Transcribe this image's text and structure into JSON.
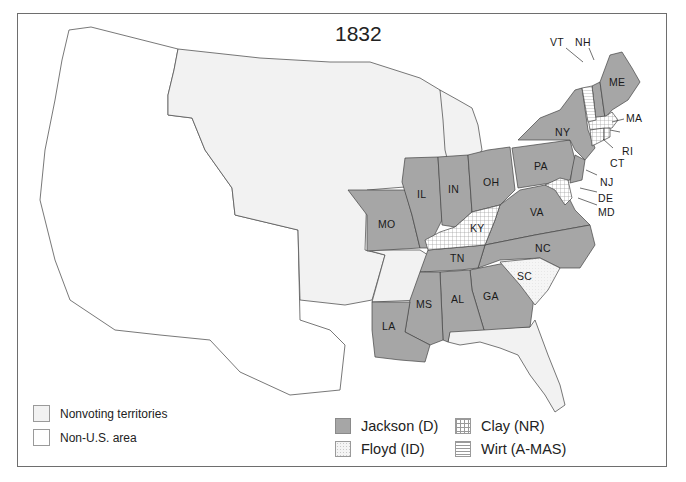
{
  "map": {
    "title": "1832",
    "subject": "U.S. presidential election results by state",
    "colors": {
      "jackson": "#a6a6a6",
      "territory": "#f2f2f2",
      "non_us": "#ffffff",
      "outline": "#555555"
    },
    "states": [
      {
        "abbr": "ME",
        "winner": "Jackson (D)"
      },
      {
        "abbr": "NH",
        "winner": "Jackson (D)"
      },
      {
        "abbr": "VT",
        "winner": "Wirt (A-MAS)"
      },
      {
        "abbr": "MA",
        "winner": "Clay (NR)"
      },
      {
        "abbr": "RI",
        "winner": "Clay (NR)"
      },
      {
        "abbr": "CT",
        "winner": "Clay (NR)"
      },
      {
        "abbr": "NY",
        "winner": "Jackson (D)"
      },
      {
        "abbr": "NJ",
        "winner": "Jackson (D)"
      },
      {
        "abbr": "PA",
        "winner": "Jackson (D)"
      },
      {
        "abbr": "DE",
        "winner": "Clay (NR)"
      },
      {
        "abbr": "MD",
        "winner": "Clay (NR)"
      },
      {
        "abbr": "VA",
        "winner": "Jackson (D)"
      },
      {
        "abbr": "NC",
        "winner": "Jackson (D)"
      },
      {
        "abbr": "SC",
        "winner": "Floyd (ID)"
      },
      {
        "abbr": "GA",
        "winner": "Jackson (D)"
      },
      {
        "abbr": "AL",
        "winner": "Jackson (D)"
      },
      {
        "abbr": "MS",
        "winner": "Jackson (D)"
      },
      {
        "abbr": "LA",
        "winner": "Jackson (D)"
      },
      {
        "abbr": "TN",
        "winner": "Jackson (D)"
      },
      {
        "abbr": "KY",
        "winner": "Clay (NR)"
      },
      {
        "abbr": "OH",
        "winner": "Jackson (D)"
      },
      {
        "abbr": "IN",
        "winner": "Jackson (D)"
      },
      {
        "abbr": "IL",
        "winner": "Jackson (D)"
      },
      {
        "abbr": "MO",
        "winner": "Jackson (D)"
      }
    ],
    "labels": {
      "ME": "ME",
      "NH": "NH",
      "VT": "VT",
      "MA": "MA",
      "RI": "RI",
      "CT": "CT",
      "NY": "NY",
      "NJ": "NJ",
      "PA": "PA",
      "DE": "DE",
      "MD": "MD",
      "VA": "VA",
      "NC": "NC",
      "SC": "SC",
      "GA": "GA",
      "AL": "AL",
      "MS": "MS",
      "LA": "LA",
      "TN": "TN",
      "KY": "KY",
      "OH": "OH",
      "IN": "IN",
      "IL": "IL",
      "MO": "MO"
    }
  },
  "legend": {
    "area_types": [
      {
        "label": "Nonvoting territories",
        "swatch": "territory"
      },
      {
        "label": "Non-U.S. area",
        "swatch": "non_us"
      }
    ],
    "candidates": [
      {
        "label": "Jackson (D)",
        "pattern": "solid-gray"
      },
      {
        "label": "Clay (NR)",
        "pattern": "grid"
      },
      {
        "label": "Floyd (ID)",
        "pattern": "dotted"
      },
      {
        "label": "Wirt (A-MAS)",
        "pattern": "horizontal-lines"
      }
    ]
  }
}
